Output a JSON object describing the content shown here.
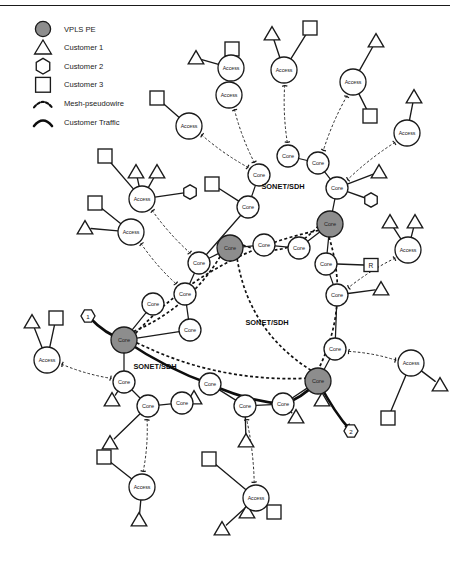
{
  "figure": {
    "background": "#ffffff",
    "rule_color": "#1a1a1a",
    "width": 450,
    "height": 572
  },
  "legend": {
    "items": [
      {
        "key": "vpls-pe",
        "label": "VPLS PE",
        "symbol": "filled-circle",
        "color": "#8d8d8d"
      },
      {
        "key": "customer-1",
        "label": "Customer 1",
        "symbol": "triangle",
        "color": "#ffffff"
      },
      {
        "key": "customer-2",
        "label": "Customer 2",
        "symbol": "hexagon",
        "color": "#ffffff"
      },
      {
        "key": "customer-3",
        "label": "Customer 3",
        "symbol": "square",
        "color": "#ffffff"
      },
      {
        "key": "mesh-pseudowire",
        "label": "Mesh-pseudowire",
        "symbol": "dotted-arc",
        "color": "#111111"
      },
      {
        "key": "customer-traffic",
        "label": "Customer Traffic",
        "symbol": "solid-arc",
        "color": "#0d0d0d"
      }
    ]
  },
  "region_labels": [
    {
      "text": "SONET/SDH",
      "x": 283,
      "y": 186
    },
    {
      "text": "SONET/SDH",
      "x": 267,
      "y": 322
    },
    {
      "text": "SONET/SDH",
      "x": 155,
      "y": 366
    }
  ],
  "markers": [
    {
      "id": "traffic-start",
      "text": "1",
      "x": 88,
      "y": 316
    },
    {
      "id": "traffic-end",
      "text": "2",
      "x": 351,
      "y": 431
    },
    {
      "id": "router",
      "text": "R",
      "x": 371,
      "y": 265
    }
  ],
  "nodes": {
    "pe": [
      {
        "id": "pe-center-left",
        "label": "Core",
        "x": 230,
        "y": 248,
        "r": 13
      },
      {
        "id": "pe-upper-right",
        "label": "Core",
        "x": 330,
        "y": 224,
        "r": 13
      },
      {
        "id": "pe-lower-left",
        "label": "Core",
        "x": 124,
        "y": 340,
        "r": 13
      },
      {
        "id": "pe-lower-right",
        "label": "Core",
        "x": 318,
        "y": 381,
        "r": 13
      }
    ],
    "core": [
      {
        "id": "core-n1",
        "label": "Core",
        "x": 259,
        "y": 175,
        "r": 11
      },
      {
        "id": "core-n2",
        "label": "Core",
        "x": 288,
        "y": 156,
        "r": 11
      },
      {
        "id": "core-n3",
        "label": "Core",
        "x": 318,
        "y": 163,
        "r": 11
      },
      {
        "id": "core-n4",
        "label": "Core",
        "x": 337,
        "y": 188,
        "r": 11
      },
      {
        "id": "core-n5",
        "label": "Core",
        "x": 248,
        "y": 207,
        "r": 11
      },
      {
        "id": "core-n6",
        "label": "Core",
        "x": 264,
        "y": 245,
        "r": 11
      },
      {
        "id": "core-n7",
        "label": "Core",
        "x": 299,
        "y": 248,
        "r": 11
      },
      {
        "id": "core-n8",
        "label": "Core",
        "x": 326,
        "y": 264,
        "r": 11
      },
      {
        "id": "core-n9",
        "label": "Core",
        "x": 337,
        "y": 295,
        "r": 11
      },
      {
        "id": "core-n10",
        "label": "Core",
        "x": 335,
        "y": 349,
        "r": 11
      },
      {
        "id": "core-n11",
        "label": "Core",
        "x": 199,
        "y": 263,
        "r": 11
      },
      {
        "id": "core-n12",
        "label": "Core",
        "x": 185,
        "y": 294,
        "r": 11
      },
      {
        "id": "core-n13",
        "label": "Core",
        "x": 153,
        "y": 304,
        "r": 11
      },
      {
        "id": "core-n14",
        "label": "Core",
        "x": 190,
        "y": 330,
        "r": 11
      },
      {
        "id": "core-n15",
        "label": "Core",
        "x": 124,
        "y": 382,
        "r": 11
      },
      {
        "id": "core-n16",
        "label": "Core",
        "x": 210,
        "y": 384,
        "r": 11
      },
      {
        "id": "core-n17",
        "label": "Core",
        "x": 148,
        "y": 406,
        "r": 11
      },
      {
        "id": "core-n18",
        "label": "Core",
        "x": 182,
        "y": 403,
        "r": 11
      },
      {
        "id": "core-n19",
        "label": "Core",
        "x": 245,
        "y": 406,
        "r": 11
      },
      {
        "id": "core-n20",
        "label": "Core",
        "x": 283,
        "y": 404,
        "r": 11
      }
    ],
    "access": [
      {
        "id": "access-a1",
        "label": "Access",
        "x": 231,
        "y": 68,
        "r": 13
      },
      {
        "id": "access-a2",
        "label": "Access",
        "x": 229,
        "y": 95,
        "r": 13
      },
      {
        "id": "access-a3",
        "label": "Access",
        "x": 284,
        "y": 70,
        "r": 13
      },
      {
        "id": "access-a4",
        "label": "Access",
        "x": 353,
        "y": 82,
        "r": 13
      },
      {
        "id": "access-a5",
        "label": "Access",
        "x": 407,
        "y": 133,
        "r": 13
      },
      {
        "id": "access-a6",
        "label": "Access",
        "x": 189,
        "y": 126,
        "r": 13
      },
      {
        "id": "access-a7",
        "label": "Access",
        "x": 142,
        "y": 199,
        "r": 13
      },
      {
        "id": "access-a8",
        "label": "Access",
        "x": 131,
        "y": 232,
        "r": 13
      },
      {
        "id": "access-a9",
        "label": "Access",
        "x": 408,
        "y": 250,
        "r": 13
      },
      {
        "id": "access-a10",
        "label": "Access",
        "x": 411,
        "y": 363,
        "r": 13
      },
      {
        "id": "access-a11",
        "label": "Access",
        "x": 47,
        "y": 360,
        "r": 13
      },
      {
        "id": "access-a12",
        "label": "Access",
        "x": 142,
        "y": 487,
        "r": 13
      },
      {
        "id": "access-a13",
        "label": "Access",
        "x": 256,
        "y": 498,
        "r": 13
      }
    ]
  },
  "cpe": {
    "triangles": [
      {
        "x": 196,
        "y": 58
      },
      {
        "x": 272,
        "y": 34
      },
      {
        "x": 376,
        "y": 41
      },
      {
        "x": 414,
        "y": 97
      },
      {
        "x": 136,
        "y": 172
      },
      {
        "x": 157,
        "y": 172
      },
      {
        "x": 85,
        "y": 228
      },
      {
        "x": 390,
        "y": 222
      },
      {
        "x": 415,
        "y": 222
      },
      {
        "x": 379,
        "y": 172
      },
      {
        "x": 381,
        "y": 289
      },
      {
        "x": 32,
        "y": 322
      },
      {
        "x": 112,
        "y": 400
      },
      {
        "x": 194,
        "y": 398
      },
      {
        "x": 246,
        "y": 441
      },
      {
        "x": 322,
        "y": 400
      },
      {
        "x": 296,
        "y": 417
      },
      {
        "x": 440,
        "y": 385
      },
      {
        "x": 139,
        "y": 520
      },
      {
        "x": 222,
        "y": 529
      },
      {
        "x": 247,
        "y": 512
      },
      {
        "x": 110,
        "y": 443
      }
    ],
    "squares": [
      {
        "x": 232,
        "y": 49
      },
      {
        "x": 310,
        "y": 28
      },
      {
        "x": 370,
        "y": 116
      },
      {
        "x": 157,
        "y": 98
      },
      {
        "x": 105,
        "y": 156
      },
      {
        "x": 95,
        "y": 203
      },
      {
        "x": 212,
        "y": 184
      },
      {
        "x": 209,
        "y": 459
      },
      {
        "x": 388,
        "y": 418
      },
      {
        "x": 56,
        "y": 318
      },
      {
        "x": 104,
        "y": 457
      },
      {
        "x": 274,
        "y": 512
      }
    ],
    "hexagons": [
      {
        "x": 190,
        "y": 192
      },
      {
        "x": 371,
        "y": 200
      }
    ]
  },
  "links": {
    "core_edges": [
      [
        "core-n1",
        "core-n5"
      ],
      [
        "core-n2",
        "core-n3"
      ],
      [
        "core-n3",
        "core-n4"
      ],
      [
        "core-n4",
        "pe-upper-right"
      ],
      [
        "core-n5",
        "core-n11"
      ],
      [
        "pe-center-left",
        "core-n6"
      ],
      [
        "core-n6",
        "core-n7"
      ],
      [
        "core-n7",
        "pe-upper-right"
      ],
      [
        "pe-upper-right",
        "core-n8"
      ],
      [
        "core-n8",
        "core-n9"
      ],
      [
        "core-n9",
        "core-n10"
      ],
      [
        "core-n10",
        "pe-lower-right"
      ],
      [
        "core-n11",
        "core-n12"
      ],
      [
        "core-n12",
        "core-n14"
      ],
      [
        "core-n14",
        "pe-lower-left"
      ],
      [
        "core-n13",
        "pe-lower-left"
      ],
      [
        "pe-lower-left",
        "core-n15"
      ],
      [
        "core-n15",
        "core-n17"
      ],
      [
        "core-n17",
        "core-n18"
      ],
      [
        "core-n16",
        "core-n19"
      ],
      [
        "core-n19",
        "core-n20"
      ],
      [
        "core-n20",
        "pe-lower-right"
      ],
      [
        "pe-center-left",
        "core-n11"
      ]
    ],
    "pseudowires": [
      [
        "access-a2",
        "core-n1"
      ],
      [
        "access-a6",
        "core-n1"
      ],
      [
        "access-a3",
        "core-n2"
      ],
      [
        "access-a4",
        "core-n3"
      ],
      [
        "access-a5",
        "core-n4"
      ],
      [
        "access-a7",
        "core-n11"
      ],
      [
        "access-a8",
        "core-n12"
      ],
      [
        "access-a9",
        "core-n9"
      ],
      [
        "access-a10",
        "core-n10"
      ],
      [
        "access-a11",
        "core-n15"
      ],
      [
        "access-a12",
        "core-n17"
      ],
      [
        "access-a13",
        "core-n19"
      ]
    ],
    "mesh_pseudowires": [
      [
        "pe-center-left",
        "pe-upper-right"
      ],
      [
        "pe-center-left",
        "pe-lower-left"
      ],
      [
        "pe-center-left",
        "pe-lower-right"
      ],
      [
        "pe-upper-right",
        "pe-lower-left"
      ],
      [
        "pe-upper-right",
        "pe-lower-right"
      ],
      [
        "pe-lower-left",
        "pe-lower-right"
      ]
    ],
    "customer_traffic_path": [
      "traffic-start",
      "pe-lower-left",
      "core-n16",
      "core-n20",
      "pe-lower-right",
      "traffic-end"
    ]
  }
}
